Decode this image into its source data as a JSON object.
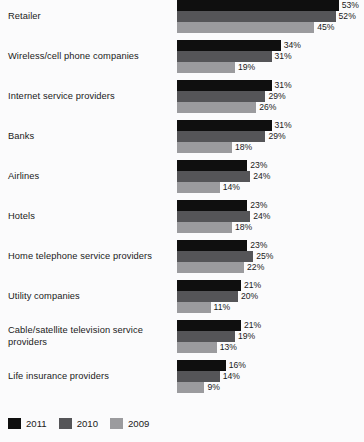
{
  "chart_data": {
    "type": "bar",
    "orientation": "horizontal",
    "title": "",
    "subtitle": "",
    "xlabel": "",
    "ylabel": "",
    "xlim": [
      0,
      60
    ],
    "grid": false,
    "legend_position": "bottom-left",
    "value_suffix": "%",
    "categories": [
      "Retailer",
      "Wireless/cell phone companies",
      "Internet service providers",
      "Banks",
      "Airlines",
      "Hotels",
      "Home telephone service providers",
      "Utility companies",
      "Cable/satellite television service providers",
      "Life insurance providers"
    ],
    "series": [
      {
        "name": "2011",
        "color": "#0f0f0f",
        "values": [
          53,
          34,
          31,
          31,
          23,
          23,
          23,
          21,
          21,
          16
        ],
        "labels": [
          "53%",
          "34%",
          "31%",
          "31%",
          "23%",
          "23%",
          "23%",
          "21%",
          "21%",
          "16%"
        ]
      },
      {
        "name": "2010",
        "color": "#555558",
        "values": [
          52,
          31,
          29,
          29,
          24,
          24,
          25,
          20,
          19,
          14
        ],
        "labels": [
          "52%",
          "31%",
          "29%",
          "29%",
          "24%",
          "24%",
          "25%",
          "20%",
          "19%",
          "14%"
        ]
      },
      {
        "name": "2009",
        "color": "#9b9b9e",
        "values": [
          45,
          19,
          26,
          18,
          14,
          18,
          22,
          11,
          13,
          9
        ],
        "labels": [
          "45%",
          "19%",
          "26%",
          "18%",
          "14%",
          "18%",
          "22%",
          "11%",
          "13%",
          "9%"
        ]
      }
    ]
  },
  "legend": {
    "items": [
      {
        "label": "2011",
        "color": "#0f0f0f"
      },
      {
        "label": "2010",
        "color": "#555558"
      },
      {
        "label": "2009",
        "color": "#9b9b9e"
      }
    ]
  },
  "colors": {
    "background": "#fbfbfc",
    "text": "#1a1a1a",
    "series_2011": "#0f0f0f",
    "series_2010": "#555558",
    "series_2009": "#9b9b9e"
  }
}
